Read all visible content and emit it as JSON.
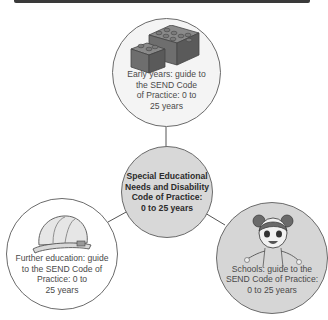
{
  "diagram": {
    "center": {
      "label": "Special Educational Needs and Disability Code of Practice: 0 to 25 years",
      "lines": [
        "Special Educational",
        "Needs and Disability",
        "Code of Practice:",
        "0 to 25 years"
      ]
    },
    "nodes": [
      {
        "id": "early-years",
        "icon": "lego-bricks-icon",
        "lines": [
          "Early years: guide to",
          "the SEND Code",
          "of Practice: 0 to",
          "25 years"
        ]
      },
      {
        "id": "further-education",
        "icon": "hard-hat-icon",
        "lines": [
          "Further education: guide",
          "to the SEND Code of",
          "Practice: 0 to",
          "25 years"
        ]
      },
      {
        "id": "schools",
        "icon": "girl-cartoon-icon",
        "lines": [
          "Schools: guide to the",
          "SEND Code of Practice:",
          "0 to 25 years"
        ]
      }
    ],
    "colors": {
      "center_fill": "#d8d8d8",
      "top_fill": "#f4f4f4",
      "left_fill": "#ffffff",
      "right_fill": "#d6d6d6",
      "stroke": "#6b6b6b"
    }
  }
}
